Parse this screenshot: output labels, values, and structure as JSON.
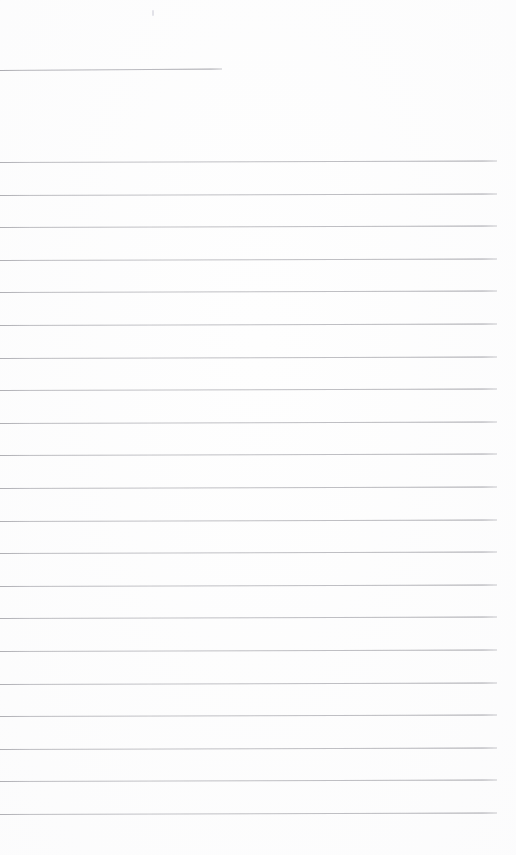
{
  "document": {
    "kind": "lined-paper-scan",
    "title": "",
    "page_width": 516,
    "page_height": 855,
    "background_color": "#fefefe",
    "content_text": "",
    "is_blank": true
  },
  "ink": {
    "rule_color": "#c6c6ca",
    "header_rule_color": "#c2c2c7",
    "speck_color": "#e2e2e8"
  },
  "ruling": {
    "header_rule": {
      "label": "header-rule",
      "x_start": 0,
      "x_end": 222,
      "y": 70,
      "tilt_px": -1.5
    },
    "body_rules": {
      "count": 21,
      "x_start": 0,
      "x_end": 497,
      "first_y": 162,
      "spacing": 32.6,
      "last_y": 821,
      "tilt_px": -1.5
    },
    "line_positions": [
      162,
      195,
      227,
      260,
      292,
      325,
      358,
      390,
      423,
      455,
      488,
      521,
      553,
      586,
      618,
      651,
      684,
      716,
      749,
      781,
      814
    ],
    "line_numbers": [
      "1",
      "2",
      "3",
      "4",
      "5",
      "6",
      "7",
      "8",
      "9",
      "10",
      "11",
      "12",
      "13",
      "14",
      "15",
      "16",
      "17",
      "18",
      "19",
      "20",
      "21"
    ]
  },
  "artifacts": {
    "specks": [
      {
        "label": "scan-speck",
        "x": 152,
        "y": 10
      }
    ]
  }
}
